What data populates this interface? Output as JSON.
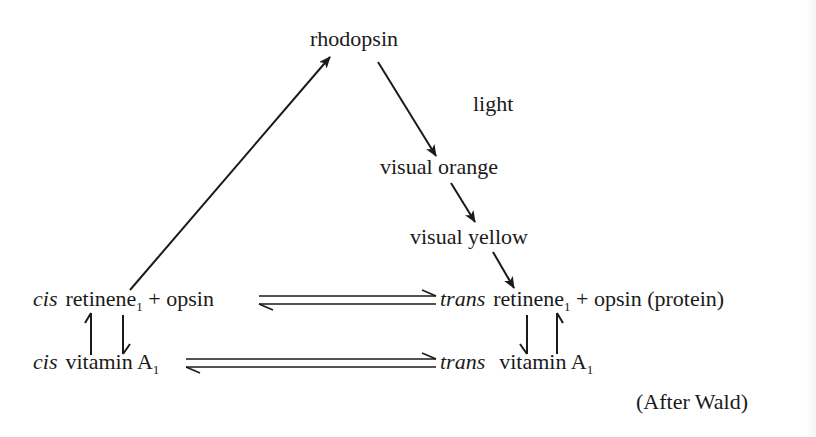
{
  "diagram": {
    "nodes": {
      "rhodopsin": "rhodopsin",
      "light": "light",
      "visual_orange": "visual orange",
      "visual_yellow": "visual yellow",
      "cis_retinene": {
        "prefix": "cis",
        "name": "retinene",
        "subscript": "1",
        "plus": "+",
        "partner": "opsin"
      },
      "trans_retinene": {
        "prefix": "trans",
        "name": "retinene",
        "subscript": "1",
        "plus": "+",
        "partner": "opsin (protein)"
      },
      "cis_vitamin": {
        "prefix": "cis",
        "name": "vitamin A",
        "subscript": "1"
      },
      "trans_vitamin": {
        "prefix": "trans",
        "name": "vitamin A",
        "subscript": "1"
      }
    },
    "edges": [
      {
        "from": "cis retinene1 + opsin",
        "to": "rhodopsin",
        "type": "arrow"
      },
      {
        "from": "rhodopsin",
        "to": "visual orange",
        "type": "arrow",
        "label": "light"
      },
      {
        "from": "visual orange",
        "to": "visual yellow",
        "type": "arrow"
      },
      {
        "from": "visual yellow",
        "to": "trans retinene1 + opsin (protein)",
        "type": "arrow"
      },
      {
        "from": "cis retinene1 + opsin",
        "to": "trans retinene1 + opsin (protein)",
        "type": "equilibrium"
      },
      {
        "from": "cis vitamin A1",
        "to": "trans vitamin A1",
        "type": "equilibrium"
      },
      {
        "from": "cis retinene1",
        "to": "cis vitamin A1",
        "type": "reversible-vertical"
      },
      {
        "from": "trans retinene1",
        "to": "trans vitamin A1",
        "type": "reversible-vertical"
      }
    ],
    "attribution": "(After Wald)"
  }
}
